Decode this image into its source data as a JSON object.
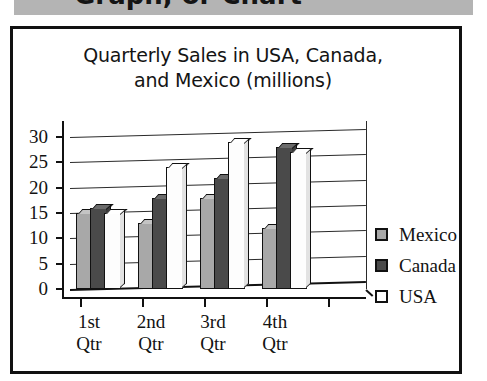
{
  "top_band": {
    "clipped_heading": "Graph, or Chart"
  },
  "chart_data": {
    "type": "bar",
    "title": "Quarterly Sales in USA, Canada, and Mexico (millions)",
    "title_lines": [
      "Quarterly Sales in USA, Canada,",
      "and Mexico (millions)"
    ],
    "xlabel": "",
    "ylabel": "",
    "categories": [
      "1st Qtr",
      "2nd Qtr",
      "3rd Qtr",
      "4th Qtr"
    ],
    "category_lines": [
      [
        "1st",
        "Qtr"
      ],
      [
        "2nd",
        "Qtr"
      ],
      [
        "3rd",
        "Qtr"
      ],
      [
        "4th",
        "Qtr"
      ]
    ],
    "series": [
      {
        "name": "Mexico",
        "color": "#a8a8a8",
        "values": [
          15,
          13,
          18,
          12
        ]
      },
      {
        "name": "Canada",
        "color": "#4a4a4a",
        "values": [
          16,
          18,
          22,
          28
        ]
      },
      {
        "name": "USA",
        "color": "#ffffff",
        "values": [
          15,
          24,
          29,
          27
        ]
      }
    ],
    "ylim": [
      0,
      30
    ],
    "y_ticks": [
      0,
      5,
      10,
      15,
      20,
      25,
      30
    ],
    "y_tick_labels": [
      "0",
      "5",
      "10",
      "15",
      "20",
      "25",
      "30"
    ],
    "grid": true,
    "legend_position": "right",
    "legend_entries": [
      "Mexico",
      "Canada",
      "USA"
    ],
    "style": "3d-column"
  }
}
